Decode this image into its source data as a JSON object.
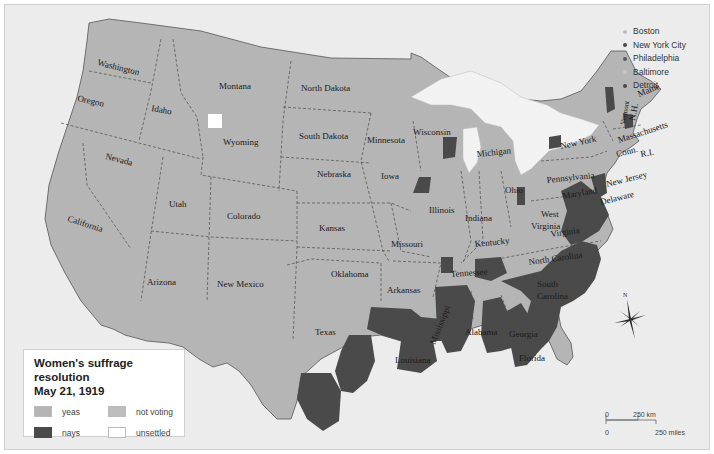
{
  "legend": {
    "title_line1": "Women's suffrage resolution",
    "title_line2": "May 21, 1919",
    "items": [
      {
        "label": "yeas",
        "color": "#b5b5b5"
      },
      {
        "label": "not voting",
        "color": "#bdbdbd"
      },
      {
        "label": "nays",
        "color": "#4a4a4a"
      },
      {
        "label": "unsettled",
        "color": "#ffffff"
      }
    ]
  },
  "cities": [
    {
      "name": "Boston",
      "color": "#bdbdbd"
    },
    {
      "name": "New York City",
      "color": "#4a4a4a"
    },
    {
      "name": "Philadelphia",
      "color": "#5a5a5a"
    },
    {
      "name": "Baltimore",
      "color": "#c8c8c8"
    },
    {
      "name": "Detroit",
      "color": "#4a4a4a"
    }
  ],
  "states": {
    "washington": "Washington",
    "oregon": "Oregon",
    "california": "California",
    "idaho": "Idaho",
    "nevada": "Nevada",
    "montana": "Montana",
    "wyoming": "Wyoming",
    "utah": "Utah",
    "arizona": "Arizona",
    "colorado": "Colorado",
    "new_mexico": "New Mexico",
    "north_dakota": "North Dakota",
    "south_dakota": "South Dakota",
    "nebraska": "Nebraska",
    "kansas": "Kansas",
    "oklahoma": "Oklahoma",
    "texas": "Texas",
    "minnesota": "Minnesota",
    "iowa": "Iowa",
    "missouri": "Missouri",
    "arkansas": "Arkansas",
    "louisiana": "Louisiana",
    "wisconsin": "Wisconsin",
    "illinois": "Illinois",
    "michigan": "Michigan",
    "indiana": "Indiana",
    "ohio": "Ohio",
    "kentucky": "Kentucky",
    "tennessee": "Tennessee",
    "mississippi": "Mississippi",
    "alabama": "Alabama",
    "georgia": "Georgia",
    "florida": "Florida",
    "south_carolina_1": "South",
    "south_carolina_2": "Carolina",
    "north_carolina": "North Carolina",
    "virginia": "Virginia",
    "west_virginia_1": "West",
    "west_virginia_2": "Virginia",
    "maryland": "Maryland",
    "delaware": "Delaware",
    "new_jersey": "New Jersey",
    "pennsylvania": "Pennsylvania",
    "new_york": "New York",
    "connecticut": "Conn.",
    "rhode_island": "R.I.",
    "massachusetts": "Massachusetts",
    "new_hampshire": "N.H.",
    "vermont": "Vermont",
    "maine": "Maine"
  },
  "compass": {
    "north_label": "N"
  },
  "scale": {
    "km_zero": "0",
    "km_label": "250 km",
    "mi_zero": "0",
    "mi_label": "250 miles"
  },
  "colors": {
    "background": "#ececec",
    "yeas": "#b5b5b5",
    "nays": "#4a4a4a",
    "water": "#f2f2f2",
    "border": "#333333"
  }
}
